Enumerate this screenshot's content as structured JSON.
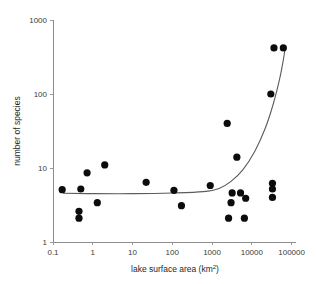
{
  "chart_data": {
    "type": "scatter",
    "title": "",
    "xlabel": "lake surface area (km2)",
    "xlabel_base": "lake surface area (km",
    "xlabel_sup": "2",
    "xlabel_close": ")",
    "ylabel": "number of species",
    "xscale": "log",
    "yscale": "log",
    "xlim": [
      0.1,
      100000
    ],
    "ylim": [
      1,
      1000
    ],
    "xticks": [
      0.1,
      1,
      10,
      100,
      1000,
      10000,
      100000
    ],
    "xtick_labels": [
      "0.1",
      "1",
      "10",
      "100",
      "1000",
      "10000",
      "100000"
    ],
    "yticks": [
      1,
      10,
      100,
      1000
    ],
    "ytick_labels": [
      "1",
      "10",
      "100",
      "1000"
    ],
    "grid": false,
    "legend": null,
    "marker": "filled-circle",
    "marker_color": "#0c0c0c",
    "points": [
      {
        "x": 0.17,
        "y": 5.1
      },
      {
        "x": 0.45,
        "y": 2.6
      },
      {
        "x": 0.45,
        "y": 2.1
      },
      {
        "x": 0.5,
        "y": 5.2
      },
      {
        "x": 0.72,
        "y": 8.6
      },
      {
        "x": 1.3,
        "y": 3.4
      },
      {
        "x": 2.0,
        "y": 11.0
      },
      {
        "x": 22,
        "y": 6.4
      },
      {
        "x": 110,
        "y": 5.0
      },
      {
        "x": 170,
        "y": 3.1
      },
      {
        "x": 900,
        "y": 5.8
      },
      {
        "x": 2400,
        "y": 40.0
      },
      {
        "x": 2600,
        "y": 2.1
      },
      {
        "x": 3000,
        "y": 3.4
      },
      {
        "x": 3200,
        "y": 4.6
      },
      {
        "x": 4200,
        "y": 14.0
      },
      {
        "x": 5200,
        "y": 4.6
      },
      {
        "x": 6500,
        "y": 2.1
      },
      {
        "x": 7000,
        "y": 3.9
      },
      {
        "x": 30000,
        "y": 100.0
      },
      {
        "x": 33000,
        "y": 6.2
      },
      {
        "x": 33000,
        "y": 5.2
      },
      {
        "x": 33000,
        "y": 4.0
      },
      {
        "x": 36000,
        "y": 420.0
      },
      {
        "x": 62000,
        "y": 420.0
      }
    ],
    "fit_line": {
      "description": "smooth fitted curve: flat near 4.5 species below 1000 km2, rising steeply above",
      "points": [
        {
          "x": 0.18,
          "y": 4.55
        },
        {
          "x": 1,
          "y": 4.5
        },
        {
          "x": 10,
          "y": 4.5
        },
        {
          "x": 100,
          "y": 4.6
        },
        {
          "x": 600,
          "y": 4.8
        },
        {
          "x": 1500,
          "y": 5.3
        },
        {
          "x": 3000,
          "y": 6.6
        },
        {
          "x": 6000,
          "y": 9.5
        },
        {
          "x": 12000,
          "y": 17.0
        },
        {
          "x": 22000,
          "y": 35.0
        },
        {
          "x": 35000,
          "y": 75.0
        },
        {
          "x": 50000,
          "y": 160.0
        },
        {
          "x": 62000,
          "y": 290.0
        },
        {
          "x": 70000,
          "y": 440.0
        }
      ]
    }
  }
}
